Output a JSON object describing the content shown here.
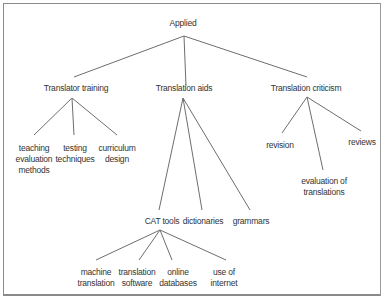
{
  "diagram": {
    "type": "tree",
    "root": {
      "label": "Applied",
      "children": [
        {
          "label": "Translator training",
          "children": [
            {
              "label": "teaching evaluation methods",
              "lines": [
                "teaching",
                "evaluation",
                "methods"
              ]
            },
            {
              "label": "testing techniques",
              "lines": [
                "testing",
                "techniques"
              ]
            },
            {
              "label": "curriculum design",
              "lines": [
                "curriculum",
                "design"
              ]
            }
          ]
        },
        {
          "label": "Translation aids",
          "children": [
            {
              "label": "CAT tools",
              "children": [
                {
                  "label": "machine translation",
                  "lines": [
                    "machine",
                    "translation"
                  ]
                },
                {
                  "label": "translation software",
                  "lines": [
                    "translation",
                    "software"
                  ]
                },
                {
                  "label": "online databases",
                  "lines": [
                    "online",
                    "databases"
                  ]
                },
                {
                  "label": "use of internet",
                  "lines": [
                    "use of",
                    "internet"
                  ]
                }
              ]
            },
            {
              "label": "dictionaries"
            },
            {
              "label": "grammars"
            }
          ]
        },
        {
          "label": "Translation criticism",
          "children": [
            {
              "label": "revision"
            },
            {
              "label": "evaluation of translations",
              "lines": [
                "evaluation of",
                "translations"
              ]
            },
            {
              "label": "reviews"
            }
          ]
        }
      ]
    }
  },
  "labels": {
    "applied": "Applied",
    "translator_training": "Translator training",
    "translation_aids": "Translation aids",
    "translation_criticism": "Translation criticism",
    "teaching": [
      "teaching",
      "evaluation",
      "methods"
    ],
    "testing": [
      "testing",
      "techniques"
    ],
    "curriculum": [
      "curriculum",
      "design"
    ],
    "cat_tools": "CAT tools",
    "dictionaries": "dictionaries",
    "grammars": "grammars",
    "revision": "revision",
    "evaluation": [
      "evaluation of",
      "translations"
    ],
    "reviews": "reviews",
    "machine": [
      "machine",
      "translation"
    ],
    "software": [
      "translation",
      "software"
    ],
    "online": [
      "online",
      "databases"
    ],
    "internet": [
      "use of",
      "internet"
    ]
  },
  "colors": {
    "line": "#6e6e6e",
    "text": "#333333",
    "border": "#8a8a8a"
  }
}
